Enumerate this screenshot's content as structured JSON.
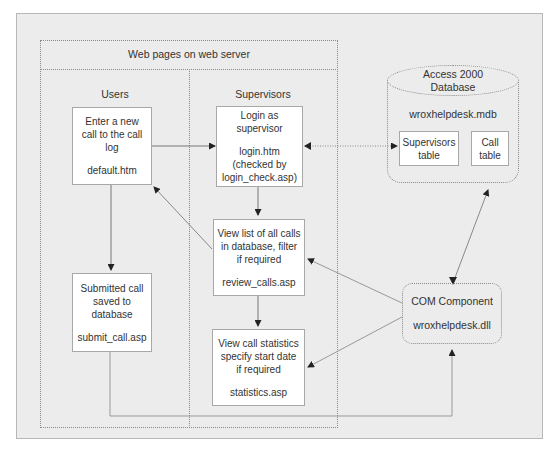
{
  "diagram": {
    "web_server": {
      "title": "Web pages on web server"
    },
    "users": {
      "title": "Users",
      "enter_call": {
        "text": [
          "Enter a new",
          "call to the call",
          "log"
        ],
        "file": "default.htm"
      },
      "submitted_call": {
        "text": [
          "Submitted call",
          "saved to",
          "database"
        ],
        "file": "submit_call.asp"
      }
    },
    "supervisors": {
      "title": "Supervisors",
      "login": {
        "text": [
          "Login as",
          "supervisor"
        ],
        "file": "login.htm",
        "note": [
          "(checked by",
          "login_check.asp)"
        ]
      },
      "review": {
        "text": [
          "View list of all calls",
          "in database, filter",
          "if required"
        ],
        "file": "review_calls.asp"
      },
      "statistics": {
        "text": [
          "View call statistics",
          "specify start date",
          "if required"
        ],
        "file": "statistics.asp"
      }
    },
    "database": {
      "title": [
        "Access 2000",
        "Database"
      ],
      "file": "wroxhelpdesk.mdb",
      "tables": [
        {
          "name": [
            "Supervisors",
            "table"
          ]
        },
        {
          "name": [
            "Call",
            "table"
          ]
        }
      ]
    },
    "com_component": {
      "title": "COM Component",
      "file": "wroxhelpdesk.dll"
    },
    "colors": {
      "panel": "#ececec",
      "box": "#ffffff",
      "line": "#8a8a8a",
      "text": "#333333"
    }
  }
}
